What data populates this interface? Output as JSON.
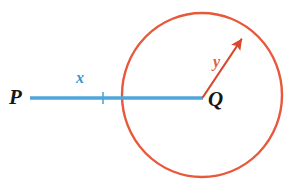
{
  "figure": {
    "background_color": "#FFFFFF",
    "labels": {
      "point_p": "P",
      "point_q": "Q",
      "segment_x": "x",
      "radius_y": "y"
    },
    "colors": {
      "segment": "#4FA6DA",
      "segment_label": "#3C94CE",
      "circle": "#E8583A",
      "radius_arrow": "#D9482B",
      "radius_label": "#E1603F",
      "point_label": "#171717"
    },
    "geometry": {
      "segment": {
        "name": "segment-pq",
        "start_x": 30,
        "start_y": 98,
        "end_x": 203,
        "end_y": 98,
        "stroke_width": 3.4,
        "tick_x": 103,
        "tick_half_height": 6,
        "tick_stroke_width": 1.6
      },
      "circle": {
        "name": "circle-at-q",
        "center_x": 202,
        "center_y": 95,
        "radius_x": 80,
        "radius_y": 82,
        "stroke_width": 2.4
      },
      "radius_arrow": {
        "name": "radius-arrow-y",
        "start_x": 203,
        "start_y": 97,
        "end_x": 245,
        "end_y": 34,
        "stroke_width": 2.2,
        "head_length": 12,
        "head_width": 8
      }
    }
  }
}
